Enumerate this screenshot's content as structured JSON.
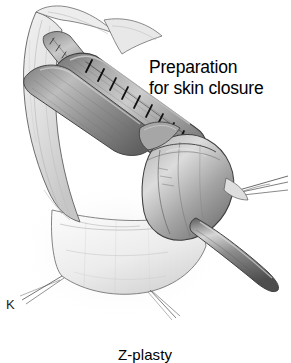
{
  "figure": {
    "panel_letter": "K",
    "caption": "Z-plasty",
    "annotation": {
      "line1": "Preparation",
      "line2": "for skin closure"
    },
    "style": {
      "background": "#ffffff",
      "ink": "#000000",
      "graphite_dark": "#3a3a3a",
      "graphite_mid": "#8d8d8d",
      "graphite_light": "#cfcfcf",
      "tissue_pale": "#efefef"
    },
    "elements": {
      "skin_flap_upper": "skin-flap-upper",
      "skin_flap_lower": "skin-flap-lower",
      "neourethral_tube": "neourethral-tube",
      "suture_line": "running-suture-line",
      "suture_count": 9,
      "glans_body": "glans-body",
      "catheter": "urethral-catheter",
      "traction_sutures": "traction-suture-threads",
      "graft_strip": "sutured-graft-strip"
    }
  }
}
